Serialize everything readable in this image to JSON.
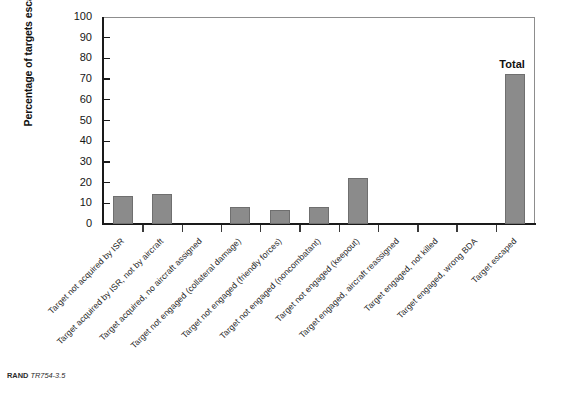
{
  "figure": {
    "source_note_prefix": "RAND",
    "source_note_id": "TR754-3.5"
  },
  "chart_data": {
    "type": "bar",
    "title": "",
    "xlabel": "",
    "ylabel": "Percentage of targets escaping",
    "ylim": [
      0,
      100
    ],
    "ytick_step": 10,
    "yticks": [
      0,
      10,
      20,
      30,
      40,
      50,
      60,
      70,
      80,
      90,
      100
    ],
    "grid": false,
    "legend": false,
    "bar_color": "#8b8b8b",
    "bar_edge_color": "#6f6f6f",
    "categories": [
      "Target not acquired by ISR",
      "Target acquired by ISR, not by aircraft",
      "Target acquired, no aircraft assigned",
      "Target not engaged (collateral damage)",
      "Target not engaged (friendly forces)",
      "Target not engaged (noncombatant)",
      "Target not engaged (keepout)",
      "Target engaged, aircraft reassigned",
      "Target engaged, not killed",
      "Target engaged, wrong BDA",
      "Target escaped"
    ],
    "values": [
      13.7,
      14.3,
      0,
      8.0,
      7.0,
      8.0,
      22.0,
      0,
      0,
      0,
      72.5
    ],
    "annotations": [
      {
        "text": "Total",
        "category": "Target escaped"
      }
    ]
  }
}
